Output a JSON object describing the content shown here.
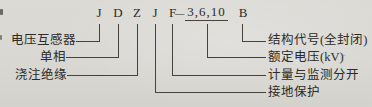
{
  "palette": {
    "background": "#d8d7d2",
    "ink": "#2e2b26",
    "line": "#46423c"
  },
  "code": {
    "tokens": [
      {
        "text": "J"
      },
      {
        "text": "D"
      },
      {
        "text": "Z"
      },
      {
        "text": "J"
      },
      {
        "text": "F"
      },
      {
        "text": "—"
      },
      {
        "text": "3,6,10"
      },
      {
        "text": "B"
      }
    ]
  },
  "labels": {
    "left": [
      {
        "text": "电压互感器"
      },
      {
        "text": "单相"
      },
      {
        "text": "浇注绝缘"
      }
    ],
    "right": [
      {
        "text": "结构代号(全封闭)"
      },
      {
        "text": "额定电压(kV)"
      },
      {
        "text": "计量与监测分开"
      },
      {
        "text": "接地保护"
      }
    ]
  },
  "artifacts": {
    "plus_mark": "+"
  }
}
